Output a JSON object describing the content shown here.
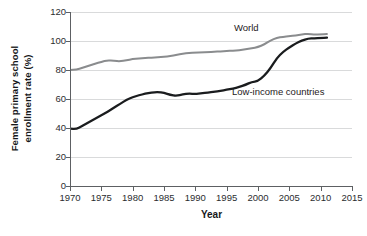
{
  "chart_data": {
    "type": "line",
    "title": "",
    "xlabel": "Year",
    "ylabel": "Female primary school enrollment rate (%)",
    "ylabel_line1": "Female primary school",
    "ylabel_line2": "enrollment rate (%)",
    "xlim": [
      1970,
      2015
    ],
    "ylim": [
      0,
      120
    ],
    "xticks": [
      1970,
      1975,
      1980,
      1985,
      1990,
      1995,
      2000,
      2005,
      2010,
      2015
    ],
    "yticks": [
      0,
      20,
      40,
      60,
      80,
      100,
      120
    ],
    "grid": "horizontal",
    "legend_position": "inline-annotations",
    "x": [
      1970,
      1971,
      1972,
      1973,
      1974,
      1975,
      1976,
      1977,
      1978,
      1979,
      1980,
      1981,
      1982,
      1983,
      1984,
      1985,
      1986,
      1987,
      1988,
      1989,
      1990,
      1991,
      1992,
      1993,
      1994,
      1995,
      1996,
      1997,
      1998,
      1999,
      2000,
      2001,
      2002,
      2003,
      2004,
      2005,
      2006,
      2007,
      2008,
      2009,
      2010,
      2011
    ],
    "series": [
      {
        "name": "World",
        "color": "#8a8c8e",
        "values": [
          80.0,
          80.2,
          81.5,
          83.0,
          84.3,
          85.6,
          86.8,
          86.3,
          86.0,
          86.7,
          87.5,
          87.9,
          88.3,
          88.6,
          88.8,
          89.1,
          89.6,
          90.4,
          91.2,
          91.8,
          92.0,
          92.2,
          92.4,
          92.6,
          92.8,
          93.1,
          93.3,
          93.6,
          94.2,
          95.0,
          95.8,
          97.6,
          100.4,
          102.2,
          102.9,
          103.4,
          103.9,
          104.5,
          105.0,
          104.4,
          104.6,
          104.8
        ]
      },
      {
        "name": "Low-income countries",
        "color": "#1a1c1e",
        "values": [
          39.5,
          39.2,
          41.5,
          44.0,
          46.4,
          48.7,
          51.2,
          54.0,
          56.6,
          59.4,
          61.2,
          62.6,
          63.6,
          64.4,
          64.8,
          64.2,
          62.8,
          62.2,
          63.2,
          63.8,
          63.4,
          63.9,
          64.4,
          65.0,
          65.6,
          66.3,
          67.2,
          68.2,
          69.8,
          71.8,
          72.3,
          76.0,
          81.2,
          88.2,
          92.5,
          95.6,
          98.3,
          100.4,
          101.6,
          101.9,
          102.1,
          102.3
        ]
      }
    ],
    "annotations": [
      {
        "text": "World",
        "series": "World"
      },
      {
        "text": "Low-income countries",
        "series": "Low-income countries"
      }
    ]
  },
  "axes": {
    "x_title": "Year",
    "y_title_line1": "Female primary school",
    "y_title_line2": "enrollment rate (%)"
  },
  "colors": {
    "world_line": "#8a8c8e",
    "low_income_line": "#1a1c1e",
    "grid": "#d9dadb",
    "axis": "#5d6063",
    "text": "#1e2022",
    "background": "#ffffff"
  },
  "artifact": {
    "bottom_text": ""
  }
}
